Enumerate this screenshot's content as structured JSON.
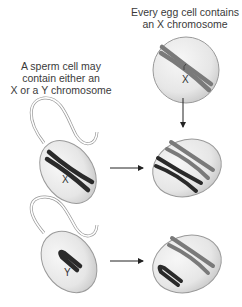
{
  "captions": {
    "egg": [
      "Every egg cell contains",
      "an X chromosome"
    ],
    "sperm": [
      "A sperm cell may",
      "contain either an",
      "X or a Y chromosome"
    ]
  },
  "cells": {
    "egg": {
      "chromosome_label": "X"
    },
    "sperm_x": {
      "chromosome_label": "X"
    },
    "sperm_y": {
      "chromosome_label": "Y"
    },
    "zygote_xx": {
      "chromosomes": [
        "X (egg)",
        "X (sperm)"
      ]
    },
    "zygote_xy": {
      "chromosomes": [
        "X (egg)",
        "Y (sperm)"
      ]
    }
  },
  "colors": {
    "egg_chromosome": "#7a7a7a",
    "sperm_chromosome": "#2a2a2a",
    "cell_fill": "#ececec",
    "cell_stroke": "#9a9a9a"
  }
}
